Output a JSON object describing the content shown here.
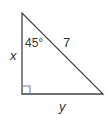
{
  "diagram": {
    "type": "right-triangle",
    "vertices": {
      "top": [
        22,
        13
      ],
      "right_angle": [
        22,
        94
      ],
      "bottom_right": [
        103,
        94
      ]
    },
    "labels": {
      "angle": "45°",
      "hypotenuse": "7",
      "vertical_leg": "x",
      "horizontal_leg": "y"
    },
    "colors": {
      "line": "#444444",
      "right_angle_marker": "#5b7fb5",
      "text": "#333333"
    }
  }
}
